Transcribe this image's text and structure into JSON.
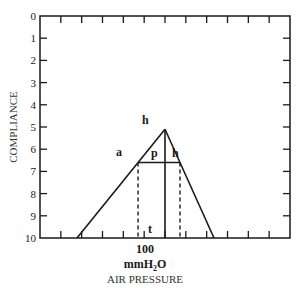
{
  "diagram": {
    "y_axis": {
      "title": "COMPLIANCE",
      "ticks": [
        "0",
        "1",
        "2",
        "3",
        "4",
        "5",
        "6",
        "7",
        "8",
        "9",
        "10"
      ],
      "range": [
        0,
        10
      ],
      "inverted": true
    },
    "x_axis": {
      "title": "AIR PRESSURE",
      "center_label": "100",
      "unit_main": "mmH",
      "unit_sub": "2",
      "unit_tail": "O",
      "tick_count_between": 11
    },
    "shape": {
      "type": "triangle",
      "apex": {
        "x_frac": 0.5,
        "y": 5.1
      },
      "base_left_frac": 0.148,
      "base_right_frac": 0.696,
      "base_y": 10,
      "crossbar_y": 6.6,
      "dashed_left_frac": 0.336,
      "dashed_right_frac": 0.508
    },
    "labels": {
      "apex": "h",
      "left": "a",
      "mid": "p",
      "right": "h",
      "bottom": "t"
    },
    "colors": {
      "line": "#1a1a1a",
      "background": "#ffffff"
    }
  }
}
